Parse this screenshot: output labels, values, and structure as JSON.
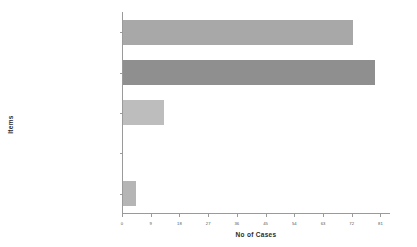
{
  "chart_data": {
    "type": "bar",
    "orientation": "horizontal",
    "title": "",
    "xlabel": "No of Cases",
    "ylabel": "Items",
    "categories": [
      "WAR_CRIMES/CRIMES_AGAINST_HUMANITY",
      "CIVIL/POLITICAL",
      "HUMAN RIGHTS GENERAL",
      "DIVERSITY/MINORITY_RIGHTS",
      "ECONOMIC/SOCIAL/CULTURAL"
    ],
    "values": [
      72,
      79,
      13,
      0,
      4
    ],
    "bar_colors": [
      "#a8a8a8",
      "#8f8f8f",
      "#bdbdbd",
      "#bdbdbd",
      "#b5b5b5"
    ],
    "xlim": [
      0,
      84
    ],
    "xticks": [
      0,
      9,
      18,
      27,
      36,
      45,
      54,
      63,
      72,
      81
    ],
    "xticklabels": [
      "0",
      "9",
      "18",
      "27",
      "36",
      "45",
      "54",
      "63",
      "72",
      "81"
    ],
    "grid": false,
    "legend": null
  }
}
